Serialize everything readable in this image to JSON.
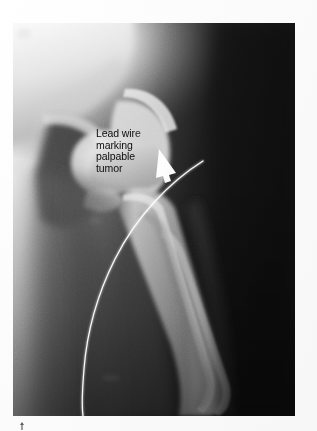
{
  "figure": {
    "kind": "radiograph",
    "modality": "X-ray",
    "body_region": "hip and proximal femur",
    "view": "anteroposterior",
    "plate": {
      "x": 13,
      "y": 23,
      "width": 282,
      "height": 393,
      "background_color": "#141414",
      "soft_tissue_color": "#3a3a3a",
      "bone_color": "#c9c9c9",
      "bright_corner_color": "#fafafa"
    }
  },
  "annotation": {
    "name": "lead-wire-callout",
    "text_color": "#0d0d0d",
    "lines": [
      "Lead wire",
      "marking",
      "palpable",
      "tumor"
    ],
    "full_text": "Lead wire marking palpable tumor",
    "position": {
      "x": 96,
      "y": 128
    }
  },
  "markers": [
    {
      "name": "arrow-marker",
      "label": "arrow pointing to lead wire",
      "color": "#ffffff",
      "from": {
        "x": 162,
        "y": 156
      },
      "to": {
        "x": 176,
        "y": 172
      }
    },
    {
      "name": "lead-wire",
      "label": "radiopaque lead wire marking palpable tumor",
      "color": "#f2f2f2",
      "stroke_width": 1.6,
      "path_points": [
        {
          "x": 198,
          "y": 163
        },
        {
          "x": 160,
          "y": 190
        },
        {
          "x": 122,
          "y": 232
        },
        {
          "x": 99,
          "y": 278
        },
        {
          "x": 88,
          "y": 330
        },
        {
          "x": 84,
          "y": 372
        },
        {
          "x": 83,
          "y": 416
        }
      ]
    },
    {
      "name": "top-horizontal-marker-line",
      "label": "bright horizontal radiopaque line",
      "color": "#ffffff",
      "x1": 24,
      "y1": 52,
      "x2": 192,
      "y2": 52
    },
    {
      "name": "cross-marker",
      "label": "radiopaque cross marker on femoral shaft",
      "color": "#f0f0f0",
      "center": {
        "x": 160,
        "y": 323
      },
      "horizontal_extent": {
        "x1": 123,
        "x2": 200
      },
      "vertical_extent": {
        "y1": 290,
        "y2": 355
      }
    },
    {
      "name": "figure-caret-tick",
      "label": "small caret tick below plate",
      "color": "#2a2a2a",
      "position": {
        "x": 19,
        "y": 422
      }
    }
  ],
  "anatomy": [
    {
      "name": "iliac-wing",
      "label": "iliac wing / pelvis"
    },
    {
      "name": "acetabulum",
      "label": "acetabulum"
    },
    {
      "name": "femoral-head",
      "label": "femoral head"
    },
    {
      "name": "femoral-neck",
      "label": "femoral neck"
    },
    {
      "name": "greater-trochanter",
      "label": "greater trochanter"
    },
    {
      "name": "lesser-trochanter",
      "label": "lesser trochanter"
    },
    {
      "name": "femoral-shaft",
      "label": "femoral shaft"
    },
    {
      "name": "soft-tissue-mass",
      "label": "soft tissue shadow over palpable tumor"
    }
  ],
  "colors": {
    "page_background": "#ffffff",
    "film_black": "#141414",
    "film_dark": "#242424",
    "soft_tissue": "#3c3c3c",
    "bone_bright": "#c7c7c7",
    "bone_brightest": "#f5f5f5",
    "marker_white": "#ffffff",
    "text": "#0d0d0d"
  }
}
